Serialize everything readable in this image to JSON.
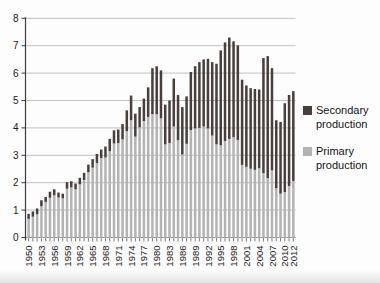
{
  "chart_data": {
    "type": "bar",
    "stacked": true,
    "title": "",
    "xlabel": "",
    "ylabel": "",
    "ylim": [
      0,
      8
    ],
    "ytick_labels": [
      "0",
      "1",
      "2",
      "3",
      "4",
      "5",
      "6",
      "7",
      "8"
    ],
    "grid": true,
    "legend_position": "right",
    "years": [
      1950,
      1951,
      1952,
      1953,
      1954,
      1955,
      1956,
      1957,
      1958,
      1959,
      1960,
      1961,
      1962,
      1963,
      1964,
      1965,
      1966,
      1967,
      1968,
      1969,
      1970,
      1971,
      1972,
      1973,
      1974,
      1975,
      1976,
      1977,
      1978,
      1979,
      1980,
      1981,
      1982,
      1983,
      1984,
      1985,
      1986,
      1987,
      1988,
      1989,
      1990,
      1991,
      1992,
      1993,
      1994,
      1995,
      1996,
      1997,
      1998,
      1999,
      2000,
      2001,
      2002,
      2003,
      2004,
      2005,
      2006,
      2007,
      2008,
      2009,
      2010,
      2011,
      2012
    ],
    "xtick_labels": [
      "1950",
      "1953",
      "1956",
      "1959",
      "1962",
      "1965",
      "1968",
      "1971",
      "1974",
      "1977",
      "1980",
      "1983",
      "1986",
      "1989",
      "1992",
      "1995",
      "1998",
      "2001",
      "2004",
      "2007",
      "2010",
      "2012"
    ],
    "series": [
      {
        "name": "Primary production",
        "color": "#b3b3b3",
        "values": [
          0.68,
          0.76,
          0.85,
          1.14,
          1.3,
          1.45,
          1.54,
          1.46,
          1.43,
          1.78,
          1.83,
          1.76,
          1.94,
          2.1,
          2.38,
          2.55,
          2.72,
          2.9,
          2.92,
          3.15,
          3.43,
          3.45,
          3.58,
          3.88,
          4.28,
          3.68,
          4.02,
          4.25,
          4.4,
          4.5,
          4.5,
          4.35,
          3.4,
          3.45,
          4.05,
          3.55,
          3.03,
          3.42,
          3.92,
          3.98,
          4.0,
          4.05,
          3.98,
          3.72,
          3.4,
          3.37,
          3.52,
          3.6,
          3.66,
          3.56,
          2.65,
          2.58,
          2.51,
          2.47,
          2.53,
          2.35,
          2.17,
          2.45,
          1.8,
          1.6,
          1.66,
          1.88,
          2.06
        ]
      },
      {
        "name": "Secondary production",
        "color": "#483e3b",
        "values": [
          0.18,
          0.19,
          0.21,
          0.22,
          0.18,
          0.22,
          0.22,
          0.18,
          0.17,
          0.24,
          0.22,
          0.21,
          0.24,
          0.26,
          0.28,
          0.31,
          0.33,
          0.31,
          0.4,
          0.45,
          0.48,
          0.49,
          0.56,
          0.76,
          0.9,
          0.84,
          0.74,
          0.82,
          1.08,
          1.68,
          1.75,
          1.75,
          1.45,
          1.55,
          1.75,
          1.65,
          1.73,
          1.73,
          2.12,
          2.27,
          2.4,
          2.45,
          2.54,
          2.68,
          2.94,
          3.46,
          3.6,
          3.7,
          3.5,
          3.45,
          3.11,
          2.97,
          2.94,
          2.95,
          2.87,
          4.2,
          4.45,
          3.73,
          2.48,
          2.62,
          3.24,
          3.32,
          3.28
        ]
      }
    ],
    "colors": {
      "gridline": "#b3b3b3",
      "axis": "#3c3c3c",
      "tick": "#4a4a4a",
      "label_text": "#1a1a1a"
    }
  },
  "legend": {
    "items": [
      {
        "label": "Secondary production"
      },
      {
        "label": "Primary production"
      }
    ]
  }
}
